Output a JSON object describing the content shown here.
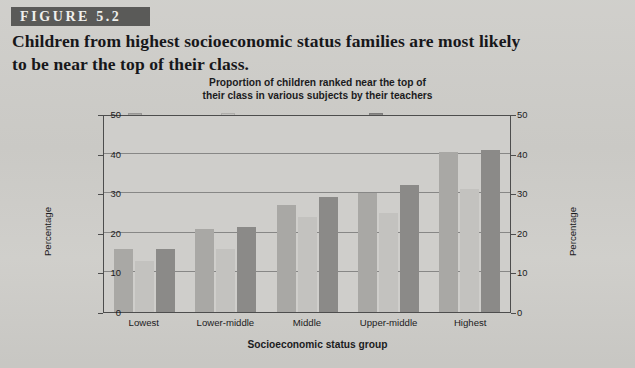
{
  "figure": {
    "banner_label": "FIGURE 5.2",
    "caption_lines": [
      "Children from highest socioeconomic status families are most likely",
      "to be near the top of their class."
    ]
  },
  "colors": {
    "page_background": "#cecdc9",
    "banner_background": "#5a5a58",
    "banner_text": "#efefec",
    "axis_line": "#4d4d4d",
    "gridline": "#6f6f6f",
    "text": "#1b1b1d",
    "series_reading": "#a9a8a5",
    "series_writing": "#c3c2bf",
    "series_mathematics": "#8b8a88"
  },
  "chart_data": {
    "type": "bar",
    "title": "Proportion of children ranked near the top of their class in various subjects by their teachers",
    "title_lines": [
      "Proportion of children ranked near the top of",
      "their class in various subjects by their teachers"
    ],
    "xlabel": "Socioeconomic status group",
    "ylabel": "Percentage",
    "ylabel_right": "Percentage",
    "categories": [
      "Lowest",
      "Lower-middle",
      "Middle",
      "Upper-middle",
      "Highest"
    ],
    "series": [
      {
        "name": "Reading",
        "color": "#a9a8a5",
        "values": [
          16,
          21,
          27,
          30,
          40.5
        ]
      },
      {
        "name": "Writing/Composition",
        "color": "#c3c2bf",
        "values": [
          13,
          16,
          24,
          25,
          31
        ]
      },
      {
        "name": "Mathematics",
        "color": "#8b8a88",
        "values": [
          16,
          21.5,
          29,
          32,
          41
        ]
      }
    ],
    "ylim": [
      0,
      50
    ],
    "yticks": [
      0,
      10,
      20,
      30,
      40,
      50
    ],
    "ytick_labels": [
      "0",
      "10",
      "20",
      "30",
      "40",
      "50"
    ],
    "grid": true,
    "grid_axis": "y",
    "legend_position": "top",
    "legend_entries": [
      "Reading",
      "Writing/Composition",
      "Mathematics"
    ]
  }
}
